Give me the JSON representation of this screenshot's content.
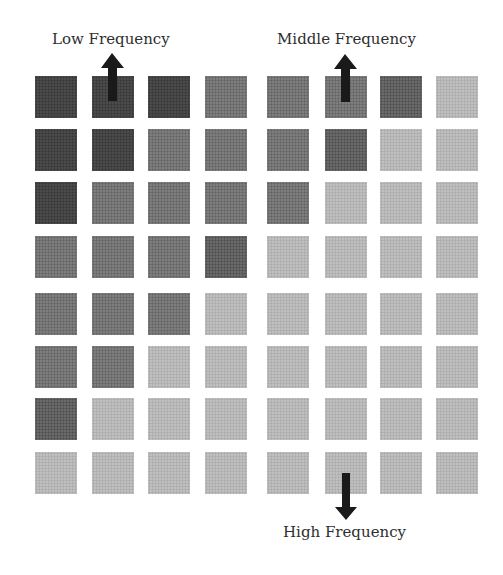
{
  "labels": {
    "low": "Low Frequency",
    "middle": "Middle Frequency",
    "high": "High Frequency"
  },
  "grid": {
    "rows": 8,
    "cols": 8,
    "col_x": [
      35,
      92,
      148,
      205,
      267,
      325,
      380,
      436
    ],
    "row_y": [
      76,
      129,
      182,
      236,
      293,
      346,
      398,
      452
    ],
    "cell_size": 42,
    "shades": [
      [
        "dark",
        "dark",
        "dark",
        "medium",
        "medium",
        "medium",
        "dark2",
        "light"
      ],
      [
        "dark",
        "dark",
        "medium",
        "medium",
        "medium",
        "dark2",
        "light",
        "light"
      ],
      [
        "dark",
        "medium",
        "medium",
        "medium",
        "medium",
        "light",
        "light",
        "light"
      ],
      [
        "medium",
        "medium",
        "medium",
        "dark2",
        "light",
        "light",
        "light",
        "light"
      ],
      [
        "medium",
        "medium",
        "medium",
        "light",
        "light",
        "light",
        "light",
        "light"
      ],
      [
        "medium",
        "medium",
        "light",
        "light",
        "light",
        "light",
        "light",
        "light"
      ],
      [
        "dark2",
        "light",
        "light",
        "light",
        "light",
        "light",
        "light",
        "light"
      ],
      [
        "light",
        "light",
        "light",
        "light",
        "light",
        "light",
        "light",
        "light"
      ]
    ]
  },
  "arrows": [
    {
      "name": "low-frequency-arrow",
      "direction": "up",
      "target": "row 1, col 2"
    },
    {
      "name": "middle-frequency-arrow",
      "direction": "up",
      "target": "row 1, col 6"
    },
    {
      "name": "high-frequency-arrow",
      "direction": "down",
      "target": "row 8, col 6"
    }
  ],
  "colors": {
    "dark": "#4b4b4b",
    "dark2": "#6a6a6a",
    "medium": "#7e7e7e",
    "light": "#bfbfbf",
    "arrow": "#1a1a1a",
    "text": "#2e2e2e"
  }
}
